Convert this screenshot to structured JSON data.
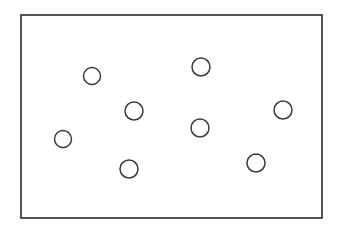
{
  "figure": {
    "name": "scattered-circles-in-rectangle",
    "background_color": "#fefefe",
    "canvas": {
      "width": 344,
      "height": 239
    },
    "bounding_box": {
      "name": "bounding-rectangle",
      "x": 21,
      "y": 15,
      "width": 301,
      "height": 203,
      "stroke_color": "#2b2b2b",
      "stroke_width": 1.6,
      "fill_color": "#ffffff"
    },
    "circle_count": 8,
    "circle_stroke_color": "#3a3a3a",
    "circle_stroke_width": 1.5,
    "circle_fill": "none",
    "circles": [
      {
        "label": "circle-1",
        "cx": 92,
        "cy": 76,
        "r": 8.5
      },
      {
        "label": "circle-2",
        "cx": 201,
        "cy": 67,
        "r": 9.0
      },
      {
        "label": "circle-3",
        "cx": 134,
        "cy": 111,
        "r": 9.0
      },
      {
        "label": "circle-4",
        "cx": 283,
        "cy": 110,
        "r": 9.0
      },
      {
        "label": "circle-5",
        "cx": 200,
        "cy": 128,
        "r": 9.0
      },
      {
        "label": "circle-6",
        "cx": 63,
        "cy": 139,
        "r": 8.5
      },
      {
        "label": "circle-7",
        "cx": 129,
        "cy": 169,
        "r": 9.0
      },
      {
        "label": "circle-8",
        "cx": 256,
        "cy": 163,
        "r": 9.0
      }
    ]
  }
}
